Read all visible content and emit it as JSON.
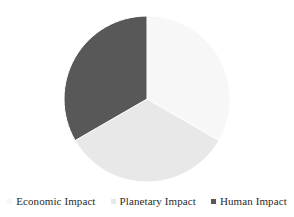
{
  "chart_data": {
    "type": "pie",
    "title": "",
    "subtitle": "",
    "xlabel": "",
    "ylabel": "",
    "grid": false,
    "legend_position": "bottom",
    "categories": [
      "Economic Impact",
      "Planetary Impact",
      "Human Impact"
    ],
    "values": [
      33.3,
      33.3,
      33.3
    ],
    "slices": [
      {
        "label": "Economic Impact",
        "value": 33.3,
        "percent": "33.3%",
        "color": "#f7f7f7",
        "start_angle_deg": 0,
        "end_angle_deg": 120,
        "marker": "square-swatch"
      },
      {
        "label": "Planetary Impact",
        "value": 33.3,
        "percent": "33.3%",
        "color": "#e8e8e8",
        "start_angle_deg": 120,
        "end_angle_deg": 240,
        "marker": "square-swatch"
      },
      {
        "label": "Human Impact",
        "value": 33.3,
        "percent": "33.3%",
        "color": "#585858",
        "start_angle_deg": 240,
        "end_angle_deg": 360,
        "marker": "square-swatch"
      }
    ],
    "geometry": {
      "center_x": 147,
      "center_y": 99,
      "radius": 83,
      "start_at_twelve_oclock": true,
      "direction": "clockwise"
    },
    "colors": {
      "economic_impact": "#f7f7f7",
      "planetary_impact": "#e8e8e8",
      "human_impact": "#585858",
      "background": "#ffffff",
      "text": "#2b2b2b"
    }
  },
  "legend": {
    "items": [
      {
        "label": "Economic Impact",
        "color": "#f7f7f7"
      },
      {
        "label": "Planetary Impact",
        "color": "#e8e8e8"
      },
      {
        "label": "Human Impact",
        "color": "#585858"
      }
    ]
  }
}
